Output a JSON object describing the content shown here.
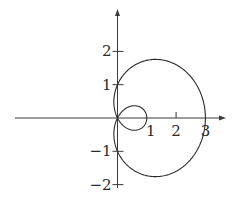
{
  "chart_data": {
    "type": "line",
    "title": "",
    "xlabel": "",
    "ylabel": "",
    "curve": "polar limaçon with inner loop",
    "equation": "r = 1 + 2cos(θ)",
    "polar": {
      "a": 1,
      "b": 2,
      "theta_range": [
        0,
        6.2832
      ]
    },
    "key_points": [
      {
        "x": 3,
        "y": 0
      },
      {
        "x": 0,
        "y": 1
      },
      {
        "x": 0,
        "y": -1
      },
      {
        "x": 1,
        "y": 0
      },
      {
        "x": 0,
        "y": 0
      }
    ],
    "xlim": [
      -3.5,
      3.7
    ],
    "ylim": [
      -2.1,
      3.2
    ],
    "x_ticks": [
      {
        "value": 1,
        "label": "1"
      },
      {
        "value": 2,
        "label": "2"
      },
      {
        "value": 3,
        "label": "3"
      }
    ],
    "y_ticks": [
      {
        "value": 2,
        "label": "2"
      },
      {
        "value": 1,
        "label": "1"
      },
      {
        "value": -1,
        "label": "−1"
      },
      {
        "value": -2,
        "label": "−2"
      }
    ],
    "grid": false,
    "legend": null
  },
  "colors": {
    "axis": "#3a3a3a",
    "curve": "#2a2a2a",
    "background": "#ffffff"
  }
}
